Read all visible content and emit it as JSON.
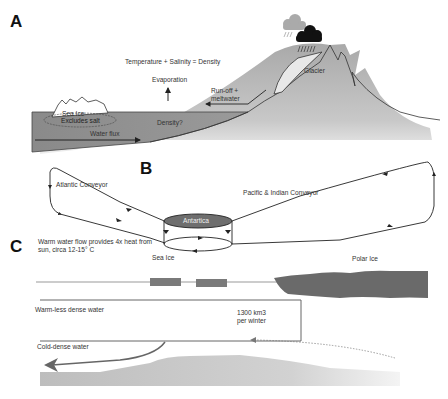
{
  "panels": {
    "a": {
      "label": "A",
      "equation": "Temperature + Salinity = Density",
      "evaporation": "Evaporation",
      "runoff": "Run-off +\nmeltwater",
      "sea_ice": "Sea Ice",
      "excludes_salt": "Excludes salt",
      "density": "Density?",
      "water_flux": "Water flux",
      "glacier": "Glacier",
      "icons": [
        "grey-cloud-icon",
        "black-rain-cloud-icon"
      ]
    },
    "b": {
      "label": "B",
      "atlantic": "Atlantic Conveyor",
      "center": "Antartica",
      "pacific": "Pacific & Indian Conveyor"
    },
    "c": {
      "label": "C",
      "warm_flow": "Warm water flow provides 4x heat from\nsun, circa 12-15° C",
      "sea_ice": "Sea Ice",
      "polar_ice": "Polar Ice",
      "warm_less_dense": "Warm-less dense water",
      "volume": "1300 km3\nper winter",
      "cold_dense": "Cold-dense water"
    }
  },
  "colors": {
    "water": "#8c8c8c",
    "mountain": "#b4b4b4",
    "glacier": "#e6e6e6",
    "antartica": "#6e6e6e",
    "polar_ice": "#6a6a6a",
    "sea_ice_block": "#7a7a7a",
    "seabed": "#c8c8c8",
    "line": "#222222"
  }
}
